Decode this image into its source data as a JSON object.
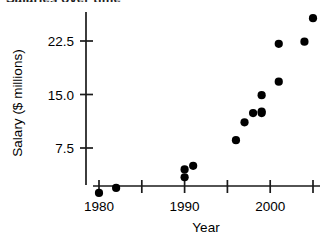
{
  "figure": {
    "clipped_title": "Salaries over time",
    "width": 330,
    "height": 240,
    "background": "#ffffff",
    "marker_color": "#000000",
    "axis_color": "#1a1a1a"
  },
  "axes": {
    "x": {
      "title": "Year",
      "tick_labels": [
        "1980",
        "",
        "1990",
        "",
        "2000",
        ""
      ],
      "tick_values": [
        1980,
        1985,
        1990,
        1995,
        2000,
        2005
      ],
      "labeled_ticks": [
        "1980",
        "1990",
        "2000"
      ],
      "range": [
        1979.0,
        2006.5
      ]
    },
    "y": {
      "title": "Salary ($ millions)",
      "tick_labels": [
        "7.5",
        "15.0",
        "22.5"
      ],
      "tick_values": [
        7.5,
        15.0,
        22.5
      ],
      "range": [
        0.0,
        28.0
      ]
    }
  },
  "chart_data": {
    "type": "scatter",
    "title": "Salaries over time",
    "xlabel": "Year",
    "ylabel": "Salary ($ millions)",
    "xlim": [
      1979.0,
      2006.5
    ],
    "ylim": [
      0.0,
      28.0
    ],
    "grid": false,
    "legend": null,
    "x": [
      1980,
      1982,
      1990,
      1990,
      1991,
      1996,
      1997,
      1998,
      1999,
      1999,
      1999,
      2001,
      2001,
      2004,
      2005
    ],
    "y": [
      1.2,
      1.9,
      3.4,
      4.5,
      5.0,
      8.6,
      11.1,
      12.4,
      12.4,
      12.6,
      14.9,
      16.8,
      22.1,
      22.4,
      25.7
    ],
    "points": [
      {
        "x": 1980,
        "y": 1.2
      },
      {
        "x": 1982,
        "y": 1.9
      },
      {
        "x": 1990,
        "y": 3.4
      },
      {
        "x": 1990,
        "y": 4.5
      },
      {
        "x": 1991,
        "y": 5.0
      },
      {
        "x": 1996,
        "y": 8.6
      },
      {
        "x": 1997,
        "y": 11.1
      },
      {
        "x": 1998,
        "y": 12.4
      },
      {
        "x": 1999,
        "y": 12.4
      },
      {
        "x": 1999,
        "y": 12.6
      },
      {
        "x": 1999,
        "y": 14.9
      },
      {
        "x": 2001,
        "y": 16.8
      },
      {
        "x": 2001,
        "y": 22.1
      },
      {
        "x": 2004,
        "y": 22.4
      },
      {
        "x": 2005,
        "y": 25.7
      }
    ]
  }
}
